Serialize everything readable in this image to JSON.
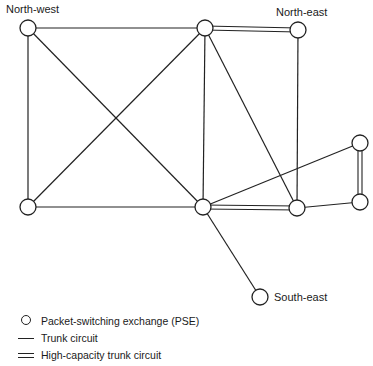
{
  "labels": {
    "north_west": "North-west",
    "north_east": "North-east",
    "south_east": "South-east"
  },
  "legend": {
    "pse": "Packet-switching exchange (PSE)",
    "trunk": "Trunk circuit",
    "high_capacity": "High-capacity trunk circuit"
  },
  "nodes": [
    {
      "id": "nw",
      "x": 28,
      "y": 28
    },
    {
      "id": "tm",
      "x": 205,
      "y": 28
    },
    {
      "id": "ne",
      "x": 298,
      "y": 30
    },
    {
      "id": "bl",
      "x": 28,
      "y": 207
    },
    {
      "id": "bm",
      "x": 203,
      "y": 207
    },
    {
      "id": "br",
      "x": 297,
      "y": 208
    },
    {
      "id": "frt",
      "x": 360,
      "y": 143
    },
    {
      "id": "frb",
      "x": 360,
      "y": 202
    },
    {
      "id": "se",
      "x": 260,
      "y": 297
    }
  ],
  "edges": [
    {
      "from": "nw",
      "to": "tm",
      "type": "trunk"
    },
    {
      "from": "nw",
      "to": "bl",
      "type": "trunk"
    },
    {
      "from": "nw",
      "to": "bm",
      "type": "trunk"
    },
    {
      "from": "tm",
      "to": "bl",
      "type": "trunk"
    },
    {
      "from": "tm",
      "to": "ne",
      "type": "high"
    },
    {
      "from": "tm",
      "to": "bm",
      "type": "trunk"
    },
    {
      "from": "tm",
      "to": "br",
      "type": "trunk"
    },
    {
      "from": "ne",
      "to": "br",
      "type": "trunk"
    },
    {
      "from": "bl",
      "to": "bm",
      "type": "trunk"
    },
    {
      "from": "bm",
      "to": "br",
      "type": "high"
    },
    {
      "from": "bm",
      "to": "frt",
      "type": "trunk"
    },
    {
      "from": "bm",
      "to": "se",
      "type": "trunk"
    },
    {
      "from": "br",
      "to": "frb",
      "type": "trunk"
    },
    {
      "from": "frt",
      "to": "frb",
      "type": "high"
    }
  ],
  "style": {
    "stroke": "#222222",
    "node_radius": 8
  }
}
